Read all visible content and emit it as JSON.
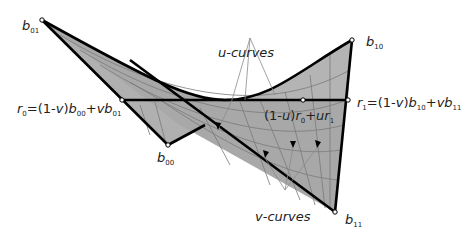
{
  "diagram": {
    "type": "bilinear surface patch",
    "colors": {
      "surface": "#a8a8a8",
      "surface_light": "#c4c4c4",
      "grid": "#7a7a7a",
      "edge": "#000000",
      "leader": "#8a8a8a",
      "text": "#222222"
    },
    "corners": [
      {
        "id": "b01",
        "base": "b",
        "sub": "01"
      },
      {
        "id": "b10",
        "base": "b",
        "sub": "10"
      },
      {
        "id": "b00",
        "base": "b",
        "sub": "00"
      },
      {
        "id": "b11",
        "base": "b",
        "sub": "11"
      }
    ],
    "labels": {
      "u_curves": "u-curves",
      "v_curves": "v-curves",
      "r0": {
        "a": "r",
        "a_sub": "0",
        "b": "=(1-",
        "c": "v",
        "d": ")",
        "e": "b",
        "e_sub": "00",
        "f": "+",
        "g": "vb",
        "g_sub": "01"
      },
      "r1": {
        "a": "r",
        "a_sub": "1",
        "b": "=(1-",
        "c": "v",
        "d": ")",
        "e": "b",
        "e_sub": "10",
        "f": "+",
        "g": "vb",
        "g_sub": "11"
      },
      "mid": {
        "a": "(1-",
        "b": "u",
        "c": ")",
        "d": "r",
        "d_sub": "0",
        "e": "+",
        "f": "ur",
        "f_sub": "1"
      }
    }
  }
}
